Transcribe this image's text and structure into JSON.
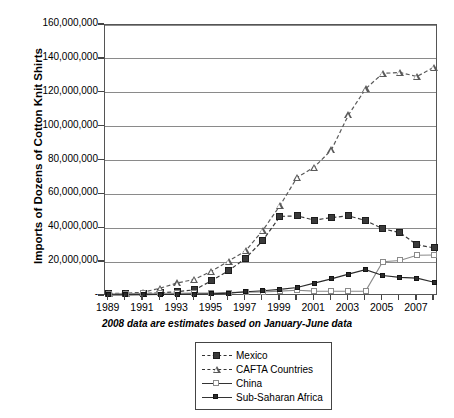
{
  "chart_data": {
    "type": "line",
    "title": "",
    "xlabel": "2008 data are estimates based on January-June data",
    "ylabel": "Imports of Dozens of Cotton Knit Shirts",
    "ylim": [
      0,
      160000000
    ],
    "xlim": [
      1989,
      2008
    ],
    "grid": true,
    "legend_position": "bottom-center",
    "x": [
      1989,
      1990,
      1991,
      1992,
      1993,
      1994,
      1995,
      1996,
      1997,
      1998,
      1999,
      2000,
      2001,
      2002,
      2003,
      2004,
      2005,
      2006,
      2007,
      2008
    ],
    "y_ticks": [
      0,
      20000000,
      40000000,
      60000000,
      80000000,
      100000000,
      120000000,
      140000000,
      160000000
    ],
    "y_tick_labels": [
      "-",
      "20,000,000",
      "40,000,000",
      "60,000,000",
      "80,000,000",
      "100,000,000",
      "120,000,000",
      "140,000,000",
      "160,000,000"
    ],
    "x_tick_labels": [
      "1989",
      "1991",
      "1993",
      "1995",
      "1997",
      "1999",
      "2001",
      "2003",
      "2005",
      "2007"
    ],
    "x_tick_years": [
      1989,
      1991,
      1993,
      1995,
      1997,
      1999,
      2001,
      2003,
      2005,
      2007
    ],
    "series": [
      {
        "name": "Mexico",
        "marker": "filled-square",
        "line": "dashed",
        "color": "#3a3a3a",
        "values": [
          1200000,
          1300000,
          1500000,
          1800000,
          2600000,
          3600000,
          9000000,
          15000000,
          22300000,
          32800000,
          47000000,
          47300000,
          44800000,
          46300000,
          47300000,
          44600000,
          39700000,
          37400000,
          30300000,
          28400000
        ]
      },
      {
        "name": "CAFTA Countries",
        "marker": "open-triangle",
        "line": "dashed",
        "color": "#5a5a5a",
        "values": [
          1500000,
          1700000,
          2200000,
          4600000,
          7700000,
          9800000,
          14600000,
          20600000,
          26700000,
          38800000,
          53400000,
          70000000,
          76100000,
          86200000,
          106900000,
          122300000,
          131400000,
          132000000,
          129600000,
          135100000
        ]
      },
      {
        "name": "China",
        "marker": "open-square",
        "line": "solid",
        "color": "#8a8a8a",
        "values": [
          1100000,
          1400000,
          1500000,
          1600000,
          1600000,
          1700000,
          1800000,
          2000000,
          2300000,
          2400000,
          2900000,
          3400000,
          2900000,
          2800000,
          2800000,
          2900000,
          20200000,
          21000000,
          24100000,
          24200000
        ]
      },
      {
        "name": "Sub-Saharan Africa",
        "marker": "filled-square-small",
        "line": "solid",
        "color": "#2b2b2b",
        "values": [
          700000,
          700000,
          800000,
          900000,
          1000000,
          1100000,
          1300000,
          1700000,
          2500000,
          3100000,
          3900000,
          5000000,
          7600000,
          10100000,
          12900000,
          15600000,
          12100000,
          11000000,
          10500000,
          8100000
        ]
      }
    ]
  },
  "axes": {
    "y_title": "Imports of Dozens of Cotton Knit Shirts",
    "x_caption": "2008 data are estimates based on January-June data"
  },
  "legend": {
    "items": [
      {
        "label": "Mexico",
        "marker": "filled-square",
        "line": "dashed"
      },
      {
        "label": "CAFTA Countries",
        "marker": "open-triangle",
        "line": "dashed"
      },
      {
        "label": "China",
        "marker": "open-square",
        "line": "solid"
      },
      {
        "label": "Sub-Saharan Africa",
        "marker": "filled-square-small",
        "line": "solid"
      }
    ]
  },
  "colors": {
    "background": "#ffffff",
    "frame": "#555555",
    "grid": "#8a8a8a",
    "mexico": "#3a3a3a",
    "cafta": "#5a5a5a",
    "china": "#8a8a8a",
    "ssa": "#2b2b2b"
  }
}
